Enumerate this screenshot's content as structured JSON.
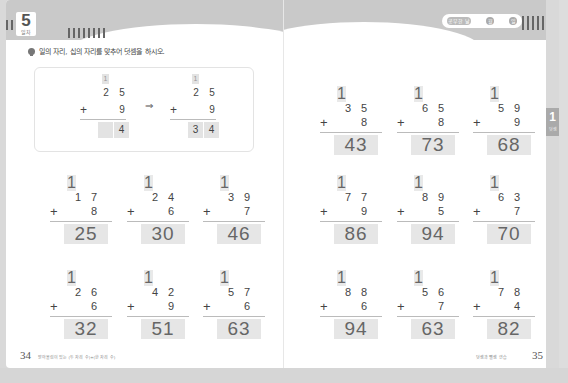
{
  "left_page": {
    "lesson_number": "5",
    "lesson_label": "일차",
    "instruction": "일의 자리, 십의 자리를 맞추어 덧셈을 하시오.",
    "example": {
      "before": {
        "carry": "1",
        "top": [
          "2",
          "5"
        ],
        "op": "+",
        "bottom": "9",
        "answer": [
          "",
          "4"
        ]
      },
      "arrow": "⇒",
      "after": {
        "carry": "1",
        "top": [
          "2",
          "5"
        ],
        "op": "+",
        "bottom": "9",
        "answer": [
          "3",
          "4"
        ]
      }
    },
    "problems": [
      {
        "carry": "1",
        "top": [
          "1",
          "7"
        ],
        "op": "+",
        "bottom": "8",
        "answer": "25"
      },
      {
        "carry": "1",
        "top": [
          "2",
          "4"
        ],
        "op": "+",
        "bottom": "6",
        "answer": "30"
      },
      {
        "carry": "1",
        "top": [
          "3",
          "9"
        ],
        "op": "+",
        "bottom": "7",
        "answer": "46"
      },
      {
        "carry": "1",
        "top": [
          "2",
          "6"
        ],
        "op": "+",
        "bottom": "6",
        "answer": "32"
      },
      {
        "carry": "1",
        "top": [
          "4",
          "2"
        ],
        "op": "+",
        "bottom": "9",
        "answer": "51"
      },
      {
        "carry": "1",
        "top": [
          "5",
          "7"
        ],
        "op": "+",
        "bottom": "6",
        "answer": "63"
      }
    ],
    "page_number": "34",
    "footer_text": "받아올림이 있는 (두 자리 수)+(한 자리 수)"
  },
  "right_page": {
    "progress_label": "공부한 날",
    "progress_dots": [
      "월",
      "일"
    ],
    "problems": [
      {
        "carry": "1",
        "top": [
          "3",
          "5"
        ],
        "op": "+",
        "bottom": "8",
        "answer": "43"
      },
      {
        "carry": "1",
        "top": [
          "6",
          "5"
        ],
        "op": "+",
        "bottom": "8",
        "answer": "73"
      },
      {
        "carry": "1",
        "top": [
          "5",
          "9"
        ],
        "op": "+",
        "bottom": "9",
        "answer": "68"
      },
      {
        "carry": "1",
        "top": [
          "7",
          "7"
        ],
        "op": "+",
        "bottom": "9",
        "answer": "86"
      },
      {
        "carry": "1",
        "top": [
          "8",
          "9"
        ],
        "op": "+",
        "bottom": "5",
        "answer": "94"
      },
      {
        "carry": "1",
        "top": [
          "6",
          "3"
        ],
        "op": "+",
        "bottom": "7",
        "answer": "70"
      },
      {
        "carry": "1",
        "top": [
          "8",
          "8"
        ],
        "op": "+",
        "bottom": "6",
        "answer": "94"
      },
      {
        "carry": "1",
        "top": [
          "5",
          "6"
        ],
        "op": "+",
        "bottom": "7",
        "answer": "63"
      },
      {
        "carry": "1",
        "top": [
          "7",
          "8"
        ],
        "op": "+",
        "bottom": "4",
        "answer": "82"
      }
    ],
    "chapter_tab": {
      "number": "1",
      "label": "덧셈"
    },
    "page_number": "35",
    "footer_text": "덧셈과 뺄셈 연습"
  }
}
